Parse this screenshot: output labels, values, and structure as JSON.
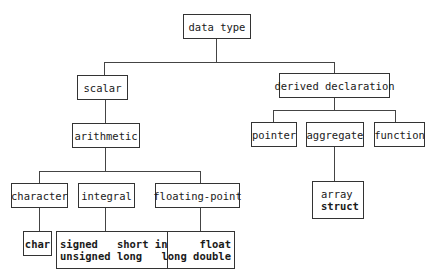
{
  "diagram": {
    "root": "data type",
    "scalar": "scalar",
    "derived": "derived declaration",
    "arithmetic": "arithmetic",
    "pointer": "pointer",
    "aggregate": "aggregate",
    "function": "function",
    "character": "character",
    "integral": "integral",
    "floating": "floating-point",
    "char": "char",
    "integral_types_line1": "signed   short int",
    "integral_types_line2": "unsigned long",
    "float_types_line1": "float",
    "float_types_line2": "long double",
    "aggregate_types_line1": "array",
    "aggregate_types_line2": "struct"
  }
}
